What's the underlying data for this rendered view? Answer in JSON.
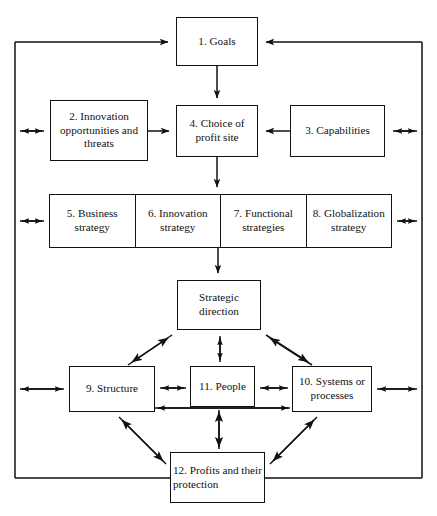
{
  "diagram": {
    "type": "flow-diagram",
    "style": {
      "line_color": "#111111",
      "box_fill": "#ffffff",
      "background": "#ffffff"
    },
    "boxes": [
      {
        "id": 1,
        "name": "goals",
        "label": "1. Goals"
      },
      {
        "id": 2,
        "name": "innovation-opportunities-and-threats",
        "label": "2. Innovation opportunities and threats"
      },
      {
        "id": 3,
        "name": "capabilities",
        "label": "3. Capabilities"
      },
      {
        "id": 4,
        "name": "choice-of-profit-site",
        "label": "4. Choice of profit site"
      },
      {
        "id": 5,
        "name": "business-strategy",
        "label": "5. Business strategy"
      },
      {
        "id": 6,
        "name": "innovation-strategy",
        "label": "6. Innovation strategy"
      },
      {
        "id": 7,
        "name": "functional-strategies",
        "label": "7. Functional strategies"
      },
      {
        "id": 8,
        "name": "globalization-strategy",
        "label": "8. Globalization strategy"
      },
      {
        "id": 9,
        "name": "structure",
        "label": "9. Structure"
      },
      {
        "id": 10,
        "name": "systems-or-processes",
        "label": "10. Systems or processes"
      },
      {
        "id": 11,
        "name": "people",
        "label": "11. People"
      },
      {
        "id": 12,
        "name": "profits-and-their-protection",
        "label": "12. Profits and their protection"
      },
      {
        "id": 13,
        "name": "strategic-direction",
        "label": "Strategic direction"
      }
    ],
    "labels": {
      "goals": "1. Goals",
      "innovation_opportunities": "2. Innovation opportunities and threats",
      "capabilities": "3. Capabilities",
      "choice_profit_site": "4. Choice of profit site",
      "business_strategy": "5. Business strategy",
      "innovation_strategy": "6. Innovation strategy",
      "functional_strategies": "7. Functional strategies",
      "globalization_strategy": "8. Globalization strategy",
      "structure": "9. Structure",
      "systems_or_processes": "10. Systems or processes",
      "people": "11. People",
      "profits": "12. Profits and their protection",
      "strategic_direction": "Strategic direction"
    },
    "connections": [
      {
        "from": "feedback-loop-left",
        "to": "goals",
        "arrow": "single"
      },
      {
        "from": "feedback-loop-right",
        "to": "goals",
        "arrow": "single"
      },
      {
        "from": "goals",
        "to": "choice-of-profit-site",
        "arrow": "single"
      },
      {
        "from": "innovation-opportunities-and-threats",
        "to": "choice-of-profit-site",
        "arrow": "single"
      },
      {
        "from": "capabilities",
        "to": "choice-of-profit-site",
        "arrow": "single"
      },
      {
        "from": "choice-of-profit-site",
        "to": "strategy-row",
        "arrow": "single"
      },
      {
        "from": "strategy-row",
        "to": "strategic-direction",
        "arrow": "single"
      },
      {
        "from": "strategic-direction",
        "to": "structure",
        "arrow": "double"
      },
      {
        "from": "strategic-direction",
        "to": "people",
        "arrow": "double"
      },
      {
        "from": "strategic-direction",
        "to": "systems-or-processes",
        "arrow": "double"
      },
      {
        "from": "structure",
        "to": "people",
        "arrow": "double"
      },
      {
        "from": "people",
        "to": "systems-or-processes",
        "arrow": "double"
      },
      {
        "from": "structure",
        "to": "systems-or-processes",
        "arrow": "double"
      },
      {
        "from": "structure",
        "to": "profits-and-their-protection",
        "arrow": "double"
      },
      {
        "from": "people",
        "to": "profits-and-their-protection",
        "arrow": "double"
      },
      {
        "from": "systems-or-processes",
        "to": "profits-and-their-protection",
        "arrow": "double"
      },
      {
        "from": "frame-left",
        "to": "innovation-opportunities-and-threats",
        "arrow": "double"
      },
      {
        "from": "frame-left",
        "to": "business-strategy",
        "arrow": "double"
      },
      {
        "from": "frame-left",
        "to": "structure",
        "arrow": "double"
      },
      {
        "from": "capabilities",
        "to": "frame-right",
        "arrow": "double"
      },
      {
        "from": "globalization-strategy",
        "to": "frame-right",
        "arrow": "double"
      },
      {
        "from": "systems-or-processes",
        "to": "frame-right",
        "arrow": "double"
      }
    ]
  }
}
